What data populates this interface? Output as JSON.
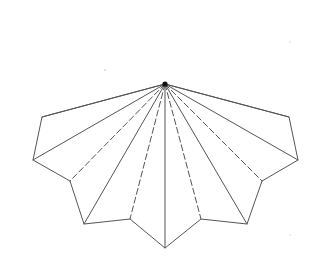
{
  "diagram": {
    "title": "",
    "colors": {
      "background": "#ffffff",
      "line": "#555555",
      "apex": "#111111"
    },
    "apex": {
      "x": 165,
      "y": 84
    },
    "outline_vertices": [
      {
        "x": 42,
        "y": 117
      },
      {
        "x": 33,
        "y": 160
      },
      {
        "x": 70,
        "y": 181
      },
      {
        "x": 84,
        "y": 224
      },
      {
        "x": 130,
        "y": 219
      },
      {
        "x": 165,
        "y": 248
      },
      {
        "x": 201,
        "y": 219
      },
      {
        "x": 247,
        "y": 224
      },
      {
        "x": 262,
        "y": 181
      },
      {
        "x": 298,
        "y": 160
      },
      {
        "x": 289,
        "y": 117
      }
    ],
    "rays": [
      {
        "to": 0,
        "style": "solid"
      },
      {
        "to": 1,
        "style": "solid"
      },
      {
        "to": 2,
        "style": "dashed"
      },
      {
        "to": 3,
        "style": "solid"
      },
      {
        "to": 4,
        "style": "dashed"
      },
      {
        "to": 5,
        "style": "solid"
      },
      {
        "to": 6,
        "style": "dashed"
      },
      {
        "to": 7,
        "style": "solid"
      },
      {
        "to": 8,
        "style": "dashed"
      },
      {
        "to": 9,
        "style": "solid"
      },
      {
        "to": 10,
        "style": "solid"
      }
    ],
    "legend": {
      "solid": "fold/cut line (solid)",
      "dashed": "fold line (dashed)"
    }
  }
}
